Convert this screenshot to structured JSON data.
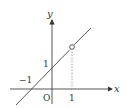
{
  "diagram": {
    "type": "coordinate-graph",
    "axes": {
      "x_label": "x",
      "y_label": "y",
      "origin_label": "O"
    },
    "ticks": {
      "x_tick": "1",
      "y_tick": "1",
      "x_intercept_label": "−1"
    },
    "line": {
      "equation": "y = x + 1",
      "open_point": [
        1,
        2
      ]
    },
    "dotted_guide": {
      "from": [
        1,
        0
      ],
      "to": [
        1,
        2
      ]
    },
    "colors": {
      "ink": "#333333",
      "dotted": "#999999"
    }
  }
}
